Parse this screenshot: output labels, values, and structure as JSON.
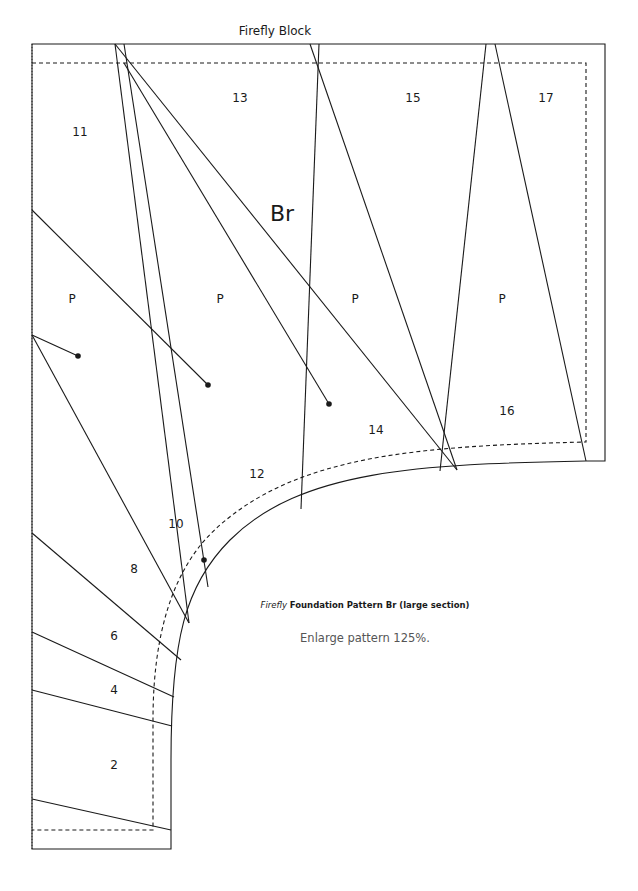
{
  "block_title": "Firefly Block",
  "section_label": "Br",
  "pieces": [
    {
      "id": "11",
      "x": 80,
      "y": 132
    },
    {
      "id": "13",
      "x": 240,
      "y": 98
    },
    {
      "id": "15",
      "x": 413,
      "y": 98
    },
    {
      "id": "17",
      "x": 546,
      "y": 98
    },
    {
      "id": "14",
      "x": 376,
      "y": 430
    },
    {
      "id": "16",
      "x": 507,
      "y": 411
    },
    {
      "id": "12",
      "x": 257,
      "y": 474
    },
    {
      "id": "10",
      "x": 176,
      "y": 524
    },
    {
      "id": "8",
      "x": 134,
      "y": 569
    },
    {
      "id": "6",
      "x": 114,
      "y": 636
    },
    {
      "id": "4",
      "x": 114,
      "y": 690
    },
    {
      "id": "2",
      "x": 114,
      "y": 765
    }
  ],
  "pleat_labels": [
    {
      "text": "P",
      "x": 72,
      "y": 299
    },
    {
      "text": "P",
      "x": 220,
      "y": 299
    },
    {
      "text": "P",
      "x": 355,
      "y": 299
    },
    {
      "text": "P",
      "x": 502,
      "y": 299
    }
  ],
  "caption": {
    "italic": "Firefly",
    "bold": "Foundation Pattern Br (large section)"
  },
  "note": "Enlarge pattern 125%.",
  "colors": {
    "line": "#1a1a1a",
    "caption_text": "#1a1a1a",
    "note_text": "#555555",
    "background": "#ffffff"
  }
}
